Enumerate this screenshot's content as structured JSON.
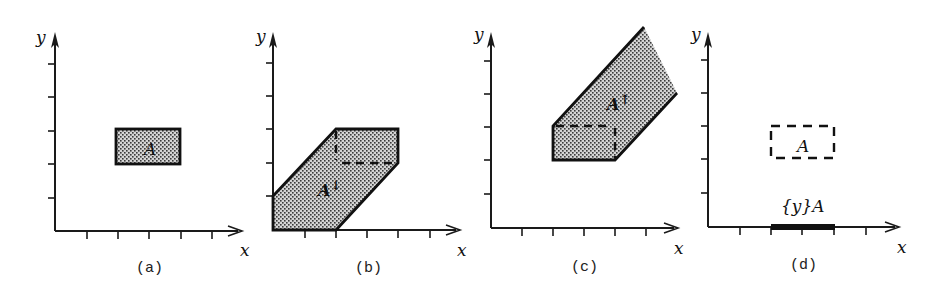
{
  "figure": {
    "panels": [
      {
        "id": "a",
        "caption": "(a)",
        "x_axis_label": "x",
        "y_axis_label": "y",
        "region_label": "A",
        "region_style": "filled-stippled",
        "region_vertices": [
          [
            2,
            2
          ],
          [
            4,
            2
          ],
          [
            4,
            3
          ],
          [
            2,
            3
          ]
        ]
      },
      {
        "id": "b",
        "caption": "(b)",
        "x_axis_label": "x",
        "y_axis_label": "y",
        "region_label": "A",
        "region_label_superscript": "↓",
        "region_style": "filled-stippled",
        "region_vertices": [
          [
            0,
            0
          ],
          [
            2,
            0
          ],
          [
            4,
            2
          ],
          [
            4,
            3
          ],
          [
            2,
            3
          ],
          [
            0,
            1
          ]
        ],
        "dashed_segments": [
          [
            [
              2,
              3
            ],
            [
              2,
              2
            ]
          ],
          [
            [
              2,
              2
            ],
            [
              4,
              2
            ]
          ]
        ]
      },
      {
        "id": "c",
        "caption": "(c)",
        "x_axis_label": "x",
        "y_axis_label": "y",
        "region_label": "A",
        "region_label_superscript": "↑",
        "region_style": "filled-stippled",
        "region_vertices": [
          [
            2,
            2
          ],
          [
            4,
            2
          ],
          [
            6,
            4
          ],
          [
            5,
            6
          ],
          [
            2,
            3
          ]
        ],
        "dashed_segments": [
          [
            [
              2,
              3
            ],
            [
              4,
              3
            ]
          ],
          [
            [
              4,
              3
            ],
            [
              4,
              2
            ]
          ]
        ]
      },
      {
        "id": "d",
        "caption": "(d)",
        "x_axis_label": "x",
        "y_axis_label": "y",
        "region_label": "A",
        "region_style": "dashed-outline",
        "region_vertices": [
          [
            2,
            2
          ],
          [
            4,
            2
          ],
          [
            4,
            3
          ],
          [
            2,
            3
          ]
        ],
        "projection_label": "{y}A",
        "projection_interval": [
          2,
          4
        ]
      }
    ],
    "ticks_per_axis": 5
  }
}
